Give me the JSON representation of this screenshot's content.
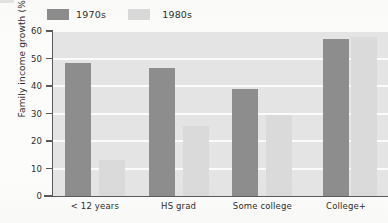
{
  "chart_data": {
    "type": "bar",
    "title": "",
    "subtitle": "",
    "xlabel": "",
    "ylabel": "Family income growth (%)",
    "categories": [
      "< 12 years",
      "HS grad",
      "Some college",
      "College+"
    ],
    "series": [
      {
        "name": "1970s",
        "color": "#8d8d8d",
        "values": [
          48.5,
          46.5,
          39.0,
          57.0
        ]
      },
      {
        "name": "1980s",
        "color": "#dadada",
        "values": [
          13.0,
          25.5,
          29.5,
          57.8
        ]
      }
    ],
    "ylim": [
      0,
      60
    ],
    "ytick_values": [
      0,
      10,
      20,
      30,
      40,
      50,
      60
    ],
    "ytick_labels": [
      "0",
      "10",
      "20",
      "30",
      "40",
      "50",
      "60"
    ],
    "grid": "horizontal",
    "grid_color": "#fbfbfb",
    "plot_background": "#e4e4e4",
    "legend_position": "above-left",
    "bar_layout": "grouped-with-gap",
    "axis_color": "#5a5a5a"
  },
  "legend": {
    "items": [
      {
        "label": "1970s",
        "swatch": "legend-swatch-1970s"
      },
      {
        "label": "1980s",
        "swatch": "legend-swatch-1980s"
      }
    ]
  },
  "axes": {
    "y_title": "Family income growth (%)",
    "y_ticks": [
      "60",
      "50",
      "40",
      "30",
      "20",
      "10",
      "0"
    ],
    "x_ticks": [
      "< 12 years",
      "HS grad",
      "Some college",
      "College+"
    ]
  }
}
